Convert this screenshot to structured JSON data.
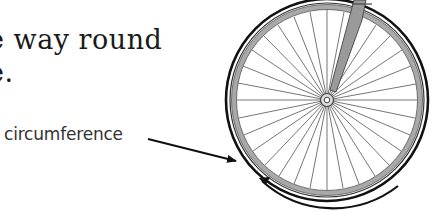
{
  "text": {
    "line1": "e way round",
    "line2": "e."
  },
  "label": {
    "circumference": "circumference"
  },
  "figure": {
    "colors": {
      "tire": "#111111",
      "rim": "#a9a9a9",
      "spoke": "#666666",
      "fork": "#9a9a9a",
      "arrow": "#111111"
    }
  }
}
